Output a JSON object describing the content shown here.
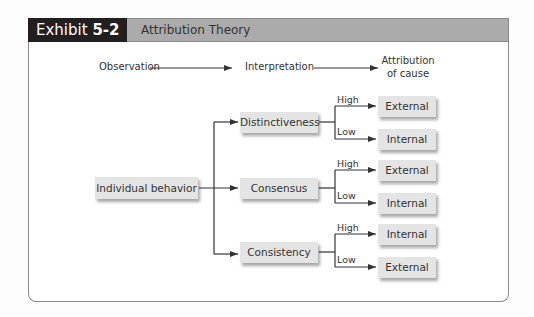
{
  "header": {
    "exhibit_prefix": "Exhibit ",
    "exhibit_number": "5-2",
    "title": "Attribution Theory"
  },
  "stages": {
    "observation": "Observation",
    "interpretation": "Interpretation",
    "attribution_line1": "Attribution",
    "attribution_line2": "of cause"
  },
  "root": {
    "label": "Individual behavior"
  },
  "factors": [
    {
      "label": "Distinctiveness",
      "high": {
        "branch": "High",
        "result": "External"
      },
      "low": {
        "branch": "Low",
        "result": "Internal"
      }
    },
    {
      "label": "Consensus",
      "high": {
        "branch": "High",
        "result": "External"
      },
      "low": {
        "branch": "Low",
        "result": "Internal"
      }
    },
    {
      "label": "Consistency",
      "high": {
        "branch": "High",
        "result": "Internal"
      },
      "low": {
        "branch": "Low",
        "result": "External"
      }
    }
  ],
  "colors": {
    "header_dark": "#231f20",
    "header_gray": "#ababab",
    "box_fill": "#e4e4e4",
    "line": "#333333"
  }
}
